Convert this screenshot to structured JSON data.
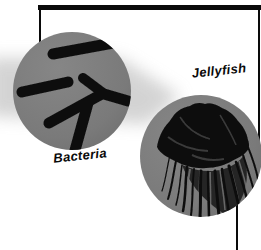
{
  "figure": {
    "background_color": "#ffffff",
    "frame_color": "#0a0a0a",
    "shading_color": "#c9c9c9",
    "callouts": [
      {
        "id": "bacteria",
        "label": "Bacteria",
        "depicts": "magnified circle showing dark rod-shaped bacteria cells",
        "circle_fill_center": "#868686",
        "circle_fill_edge": "#6e6e6e",
        "ink_color": "#101010"
      },
      {
        "id": "jellyfish",
        "label": "Jellyfish",
        "depicts": "magnified circle showing a dark jellyfish with trailing tentacles",
        "circle_fill_center": "#868686",
        "circle_fill_edge": "#6e6e6e",
        "ink_color": "#0c0c0c"
      }
    ]
  }
}
